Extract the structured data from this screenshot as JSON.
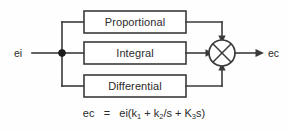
{
  "diagram": {
    "input": {
      "label": "ei",
      "name": "input-signal"
    },
    "output": {
      "label": "ec",
      "name": "output-signal"
    },
    "junction": {
      "name": "branch-node"
    },
    "summing_junction": {
      "name": "summing-junction",
      "symbol": "circle-with-cross",
      "inputs": [
        "top",
        "left",
        "bottom"
      ],
      "outputs": [
        "right"
      ]
    },
    "blocks": [
      {
        "label": "Proportional",
        "gain": "k1",
        "path": "top"
      },
      {
        "label": "Integral",
        "gain": "k2/s",
        "path": "middle"
      },
      {
        "label": "Differential",
        "gain": "K3s",
        "path": "bottom"
      }
    ],
    "equation": {
      "lhs": "ec",
      "eq": "=",
      "rhs_open": "ei(k",
      "sub1": "1",
      "plus1": " + k",
      "sub2": "2",
      "mid": "/s + K",
      "sub3": "3",
      "rhs_close": "s)",
      "plain": "ec = ei(k1 + k2/s + K3s)"
    },
    "colors": {
      "line": "#3a3a3a",
      "text": "#2b2b2b",
      "background": "#fefefe",
      "block_fill": "#ffffff",
      "node": "#1c1c1c"
    }
  }
}
